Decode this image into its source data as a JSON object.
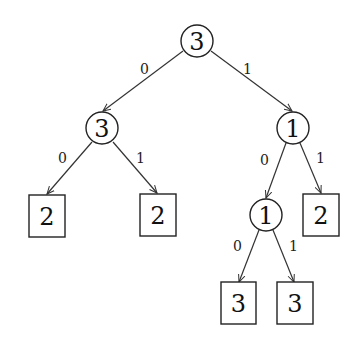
{
  "tree": {
    "nodes": [
      {
        "id": "root",
        "type": "circle",
        "label": "3",
        "cx": 197,
        "cy": 41
      },
      {
        "id": "n0",
        "type": "circle",
        "label": "3",
        "cx": 102,
        "cy": 128
      },
      {
        "id": "n1",
        "type": "circle",
        "label": "1",
        "cx": 293,
        "cy": 128
      },
      {
        "id": "n00",
        "type": "box",
        "label": "2",
        "cx": 47,
        "cy": 216
      },
      {
        "id": "n01",
        "type": "box",
        "label": "2",
        "cx": 158,
        "cy": 215
      },
      {
        "id": "n10",
        "type": "circle",
        "label": "1",
        "cx": 266,
        "cy": 215
      },
      {
        "id": "n11",
        "type": "box",
        "label": "2",
        "cx": 321,
        "cy": 215
      },
      {
        "id": "n100",
        "type": "box",
        "label": "3",
        "cx": 239,
        "cy": 303
      },
      {
        "id": "n101",
        "type": "box",
        "label": "3",
        "cx": 295,
        "cy": 303
      }
    ],
    "edges": [
      {
        "from": "root",
        "to": "n0",
        "label": "0"
      },
      {
        "from": "root",
        "to": "n1",
        "label": "1"
      },
      {
        "from": "n0",
        "to": "n00",
        "label": "0"
      },
      {
        "from": "n0",
        "to": "n01",
        "label": "1"
      },
      {
        "from": "n1",
        "to": "n10",
        "label": "0"
      },
      {
        "from": "n1",
        "to": "n11",
        "label": "1"
      },
      {
        "from": "n10",
        "to": "n100",
        "label": "0"
      },
      {
        "from": "n10",
        "to": "n101",
        "label": "1"
      }
    ]
  }
}
